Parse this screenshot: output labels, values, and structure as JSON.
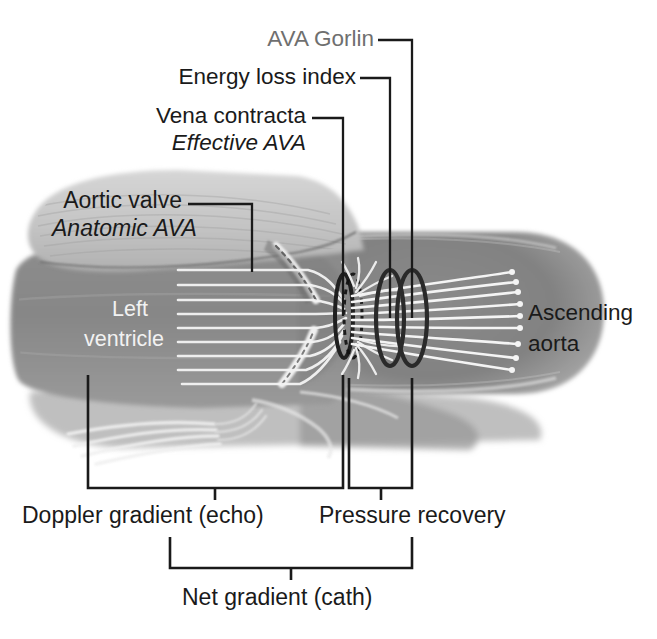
{
  "figure": {
    "background_color": "#ffffff"
  },
  "colors": {
    "label_black": "#1a1a1a",
    "label_gray": "#6f6f6f",
    "label_white": "#f2f2f2",
    "leader_line": "#1a1a1a",
    "bracket": "#1a1a1a",
    "myocardium_light": "#c9c9c9",
    "chamber_gray": "#8a8a8a",
    "aorta_gray": "#8f8f8f",
    "flow_line": "#f5f5f5",
    "ring_dark": "#262626"
  },
  "labels": {
    "ava_gorlin": "AVA Gorlin",
    "energy_loss_index": "Energy loss index",
    "vena_contracta": "Vena contracta",
    "effective_ava": "Effective AVA",
    "aortic_valve": "Aortic valve",
    "anatomic_ava": "Anatomic AVA",
    "left_ventricle_line1": "Left",
    "left_ventricle_line2": "ventricle",
    "ascending_aorta_line1": "Ascending",
    "ascending_aorta_line2": "aorta",
    "doppler_gradient": "Doppler gradient (echo)",
    "pressure_recovery": "Pressure recovery",
    "net_gradient": "Net gradient (cath)"
  },
  "annotations": [
    {
      "id": "ava-gorlin",
      "text": "AVA Gorlin",
      "style": "gray",
      "italic": false,
      "points_to": "third-ring-outer-aorta"
    },
    {
      "id": "energy-loss-index",
      "text": "Energy loss index",
      "style": "black",
      "italic": false,
      "points_to": "second-ring"
    },
    {
      "id": "vena-contracta",
      "text": "Vena contracta",
      "style": "black",
      "italic": false,
      "points_to": "vena-contracta-ring"
    },
    {
      "id": "effective-ava",
      "text": "Effective AVA",
      "style": "black",
      "italic": true,
      "points_to": "vena-contracta-ring"
    },
    {
      "id": "aortic-valve",
      "text": "Aortic valve",
      "style": "black",
      "italic": false,
      "points_to": "valve-leaflet"
    },
    {
      "id": "anatomic-ava",
      "text": "Anatomic AVA",
      "style": "black",
      "italic": true,
      "points_to": "valve-leaflet"
    }
  ],
  "brackets": [
    {
      "id": "doppler-gradient-bracket",
      "label": "Doppler gradient (echo)",
      "span_from": "left-ventricle",
      "span_to": "vena-contracta"
    },
    {
      "id": "pressure-recovery-bracket",
      "label": "Pressure recovery",
      "span_from": "vena-contracta",
      "span_to": "ascending-aorta"
    },
    {
      "id": "net-gradient-bracket",
      "label": "Net gradient (cath)",
      "span_from": "left-ventricle",
      "span_to": "ascending-aorta"
    }
  ],
  "anatomy": {
    "structures": [
      "myocardium",
      "left ventricle chamber",
      "aortic valve leaflets",
      "ascending aorta",
      "mitral apparatus"
    ],
    "flow": {
      "streamlines_ventricle": 10,
      "jet_lines_aorta": 9,
      "recirculation_swirls": 2,
      "rings": 3
    }
  }
}
